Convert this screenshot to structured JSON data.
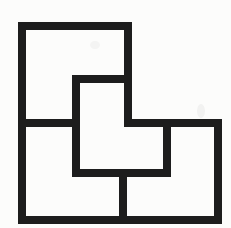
{
  "canvas": {
    "width": 231,
    "height": 228,
    "background": "#fcfcfb"
  },
  "figure": {
    "name": "l-region-divided-into-four-l-pieces",
    "stroke_color": "#1d1d1d",
    "stroke_width": 8,
    "outline_points": [
      [
        22,
        26
      ],
      [
        128,
        26
      ],
      [
        128,
        123
      ],
      [
        218,
        123
      ],
      [
        218,
        220
      ],
      [
        22,
        220
      ]
    ],
    "segments": [
      {
        "name": "divider-topleft-piece-bottom",
        "from": [
          22,
          123
        ],
        "to": [
          76,
          123
        ]
      },
      {
        "name": "divider-middle-piece-left",
        "from": [
          76,
          79
        ],
        "to": [
          76,
          173
        ]
      },
      {
        "name": "divider-middle-piece-top",
        "from": [
          76,
          79
        ],
        "to": [
          128,
          79
        ]
      },
      {
        "name": "divider-middle-piece-bottom",
        "from": [
          76,
          173
        ],
        "to": [
          167,
          173
        ]
      },
      {
        "name": "divider-right-piece-left",
        "from": [
          167,
          123
        ],
        "to": [
          167,
          173
        ]
      },
      {
        "name": "divider-bottom-pieces",
        "from": [
          123,
          173
        ],
        "to": [
          123,
          220
        ]
      }
    ],
    "smudges": [
      {
        "cx": 201,
        "cy": 111,
        "rx": 4,
        "ry": 7,
        "opacity": 0.05
      },
      {
        "cx": 95,
        "cy": 45,
        "rx": 5,
        "ry": 4,
        "opacity": 0.04
      }
    ]
  }
}
